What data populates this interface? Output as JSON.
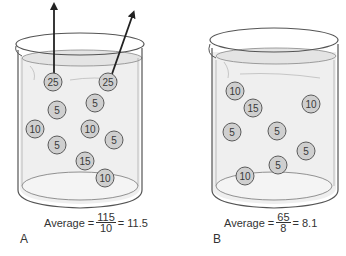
{
  "panels": [
    {
      "id": "A",
      "label": "A",
      "average_text": "Average = ",
      "numerator": "115",
      "denominator": "10",
      "result_text": "= 11.5",
      "balls": [
        {
          "value": "25",
          "x": 53,
          "y": 82,
          "escaping": true
        },
        {
          "value": "25",
          "x": 108,
          "y": 82,
          "escaping": true
        },
        {
          "value": "5",
          "x": 95,
          "y": 103
        },
        {
          "value": "5",
          "x": 57,
          "y": 110
        },
        {
          "value": "10",
          "x": 35,
          "y": 129
        },
        {
          "value": "10",
          "x": 90,
          "y": 129
        },
        {
          "value": "5",
          "x": 114,
          "y": 140
        },
        {
          "value": "5",
          "x": 57,
          "y": 145
        },
        {
          "value": "15",
          "x": 85,
          "y": 161
        },
        {
          "value": "10",
          "x": 105,
          "y": 178
        }
      ]
    },
    {
      "id": "B",
      "label": "B",
      "average_text": "Average = ",
      "numerator": "65",
      "denominator": "8",
      "result_text": "= 8.1",
      "balls": [
        {
          "value": "10",
          "x": 235,
          "y": 91
        },
        {
          "value": "15",
          "x": 253,
          "y": 108
        },
        {
          "value": "10",
          "x": 311,
          "y": 104
        },
        {
          "value": "5",
          "x": 232,
          "y": 132
        },
        {
          "value": "5",
          "x": 277,
          "y": 131
        },
        {
          "value": "5",
          "x": 306,
          "y": 151
        },
        {
          "value": "5",
          "x": 278,
          "y": 165
        },
        {
          "value": "10",
          "x": 245,
          "y": 176
        }
      ]
    }
  ],
  "colors": {
    "ball_fill": "#cfcfcf",
    "ball_stroke": "#5a5a5a",
    "water": "#ececec",
    "outline": "#555555",
    "arrow": "#222222"
  }
}
